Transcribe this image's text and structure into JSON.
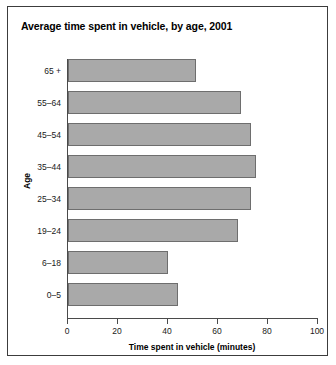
{
  "chart_data": {
    "type": "bar",
    "orientation": "horizontal",
    "title": "Average time spent in vehicle, by age, 2001",
    "xlabel": "Time spent in vehicle (minutes)",
    "ylabel": "Age",
    "categories": [
      "0–5",
      "6–18",
      "19–24",
      "25–34",
      "35–44",
      "45–54",
      "55–64",
      "65 +"
    ],
    "values": [
      44,
      40,
      68,
      73,
      75,
      73,
      69,
      51
    ],
    "xlim": [
      0,
      100
    ],
    "xticks": [
      0,
      20,
      40,
      60,
      80,
      100
    ],
    "xtick_labels": [
      "0",
      "20",
      "40",
      "60",
      "80",
      "100"
    ],
    "grid": false,
    "legend": false,
    "bar_fill_color": "#a9a9a9",
    "bar_border_color": "#6e6e6e",
    "frame_color": "#3c3c3c"
  }
}
